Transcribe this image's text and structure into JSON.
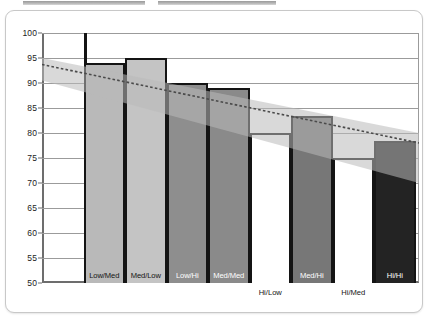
{
  "top_strips": [
    {
      "name": "legend-strip-left"
    },
    {
      "name": "legend-strip-right"
    }
  ],
  "axis": {
    "y_ticks": [
      "100",
      "95",
      "90",
      "85",
      "80",
      "75",
      "70",
      "65",
      "60",
      "55",
      "50"
    ]
  },
  "chart_data": {
    "type": "bar",
    "title": "",
    "subtitle": "",
    "xlabel": "",
    "ylabel": "",
    "ylim": [
      50,
      100
    ],
    "y_ticks": [
      50,
      55,
      60,
      65,
      70,
      75,
      80,
      85,
      90,
      95,
      100
    ],
    "grid": true,
    "legend": "none",
    "categories": [
      "Low/Low",
      "Low/Med",
      "Med/Low",
      "Low/Hi",
      "Med/Med",
      "Hi/Low",
      "Med/Hi",
      "Hi/Med",
      "Hi/Hi"
    ],
    "values": [
      50,
      94,
      95,
      90,
      89,
      80,
      83.5,
      75,
      78.5
    ],
    "bar_colors": [
      "#ffffff",
      "#b9b9b9",
      "#c4c4c4",
      "#8e8e8e",
      "#8a8a8a",
      "#ffffff",
      "#777777",
      "#ffffff",
      "#232323"
    ],
    "bar_label_on_dark": [
      false,
      false,
      false,
      true,
      true,
      false,
      true,
      false,
      true
    ],
    "labels_outside_bar": [
      false,
      false,
      false,
      false,
      false,
      true,
      false,
      true,
      false
    ],
    "annotations": [
      {
        "name": "upper-whisker",
        "category": "Low/Med",
        "value": 100
      }
    ],
    "series": [
      {
        "name": "trend-line",
        "type": "line",
        "style": "dotted",
        "x_endpoints": [
          "axis-left",
          "axis-right"
        ],
        "y_endpoints": [
          93.7,
          78.0
        ]
      },
      {
        "name": "confidence-band",
        "type": "area",
        "upper_endpoints": [
          95.0,
          80.0
        ],
        "lower_endpoints": [
          90.5,
          70.0
        ]
      }
    ]
  }
}
